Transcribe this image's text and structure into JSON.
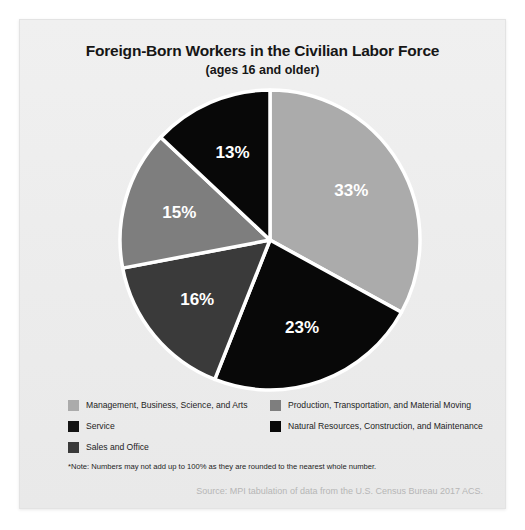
{
  "chart_data": {
    "type": "pie",
    "title": "Foreign-Born Workers in the Civilian Labor Force",
    "subtitle": "(ages 16 and older)",
    "categories": [
      "Management, Business, Science, and Arts",
      "Natural Resources, Construction, and Maintenance",
      "Sales and Office",
      "Production, Transportation, and Material Moving",
      "Service"
    ],
    "values": [
      33,
      23,
      16,
      15,
      13
    ],
    "labels": [
      "33%",
      "23%",
      "16%",
      "15%",
      "13%"
    ],
    "colors": [
      "#ababab",
      "#080808",
      "#3a3a3a",
      "#7e7e7e",
      "#080808"
    ],
    "slice_gap_color": "#ffffff",
    "start_angle_deg": 0,
    "direction": "clockwise",
    "legend_position": "bottom",
    "grid": false,
    "xlabel": "",
    "ylabel": ""
  },
  "legend": {
    "left_column": [
      {
        "label": "Management, Business, Science, and Arts",
        "color": "#ababab"
      },
      {
        "label": "Service",
        "color": "#141414"
      },
      {
        "label": "Sales and Office",
        "color": "#3a3a3a"
      }
    ],
    "right_column": [
      {
        "label": "Production, Transportation, and Material Moving",
        "color": "#7e7e7e"
      },
      {
        "label": "Natural Resources, Construction, and Maintenance",
        "color": "#080808"
      }
    ]
  },
  "footer": {
    "note": "*Note: Numbers may not add up to 100% as they are rounded to the nearest whole number.",
    "source": "Source: MPI tabulation of data from the U.S. Census Bureau 2017 ACS."
  }
}
